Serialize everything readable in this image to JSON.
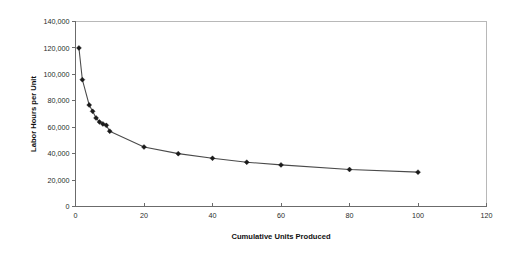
{
  "chart_data": {
    "type": "line",
    "title": "",
    "subtitle": "",
    "xlabel": "Cumulative Units Produced",
    "ylabel": "Labor Hours per Unit",
    "xlim": [
      0,
      120
    ],
    "ylim": [
      0,
      140000
    ],
    "xticks": [
      0,
      20,
      40,
      60,
      80,
      100,
      120
    ],
    "xtick_labels": [
      "0",
      "20",
      "40",
      "60",
      "80",
      "100",
      "120"
    ],
    "yticks": [
      0,
      20000,
      40000,
      60000,
      80000,
      100000,
      120000,
      140000
    ],
    "ytick_labels": [
      "0",
      "20,000",
      "40,000",
      "60,000",
      "80,000",
      "100,000",
      "120,000",
      "140,000"
    ],
    "grid": false,
    "legend": false,
    "legend_position": "none",
    "marker": "diamond",
    "line_color": "#4a4a4a",
    "marker_color": "#1a1a1a",
    "series": [
      {
        "name": "Labor Hours per Unit",
        "x": [
          1,
          2,
          4,
          5,
          6,
          7,
          8,
          9,
          10,
          20,
          30,
          40,
          50,
          60,
          80,
          100
        ],
        "values": [
          120000,
          96000,
          76800,
          72000,
          67000,
          64000,
          62500,
          61400,
          57000,
          45000,
          40000,
          36500,
          33500,
          31500,
          28000,
          26000
        ]
      }
    ]
  },
  "axes": {
    "x_title": "Cumulative Units Produced",
    "y_title": "Labor Hours per Unit"
  }
}
